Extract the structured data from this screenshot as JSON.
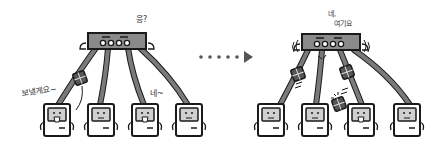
{
  "diagram": {
    "left_panel": {
      "hub_speech": "응?",
      "sender_speech": "보낼게요~",
      "receiver_speech": "네~",
      "computers": 4
    },
    "transition": {
      "icon": "dotted-arrow-right-icon"
    },
    "right_panel": {
      "hub_speech_line1": "네,",
      "hub_speech_line2": "여기요",
      "computers": 4
    },
    "colors": {
      "outline": "#1a1a1a",
      "hub_fill": "#8a8a8a",
      "cable": "#7a7a7a",
      "screen": "#d0d0d0",
      "packet": "#555555",
      "arrow": "#555555"
    }
  }
}
